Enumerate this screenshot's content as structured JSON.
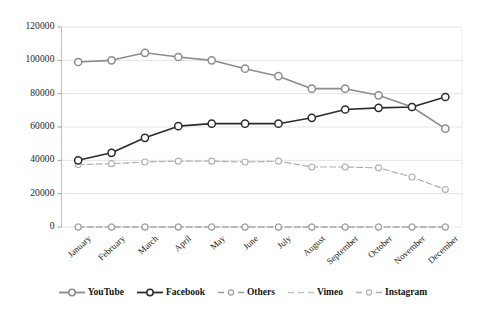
{
  "chart_data": {
    "type": "line",
    "title": "",
    "xlabel": "",
    "ylabel": "",
    "categories": [
      "January",
      "February",
      "March",
      "April",
      "May",
      "June",
      "July",
      "August",
      "September",
      "October",
      "November",
      "December"
    ],
    "ylim": [
      0,
      120000
    ],
    "ytick_values": [
      0,
      20000,
      40000,
      60000,
      80000,
      100000,
      120000
    ],
    "ytick_labels": [
      "0",
      "20000",
      "40000",
      "60000",
      "80000",
      "100000",
      "120000"
    ],
    "grid": "horizontal",
    "legend_position": "bottom",
    "series": [
      {
        "name": "YouTube",
        "color": "#8c8c8c",
        "marker": "circle-open",
        "dash": "solid",
        "values": [
          99000,
          100000,
          104500,
          102000,
          100000,
          95000,
          90500,
          83000,
          83000,
          79000,
          72000,
          59000
        ]
      },
      {
        "name": "Facebook",
        "color": "#2b2b2b",
        "marker": "circle-open",
        "dash": "solid",
        "values": [
          40000,
          44500,
          53500,
          60500,
          62000,
          62000,
          62000,
          65500,
          70500,
          71500,
          72000,
          78000
        ]
      },
      {
        "name": "Others",
        "color": "#9a9a9a",
        "marker": "circle-open",
        "dash": "dashed",
        "values": [
          0,
          0,
          0,
          0,
          0,
          0,
          0,
          0,
          0,
          0,
          0,
          0
        ]
      },
      {
        "name": "Vimeo",
        "color": "#c2c2c2",
        "marker": "circle-open",
        "dash": "dashed",
        "values": [
          0,
          0,
          0,
          0,
          0,
          0,
          0,
          0,
          0,
          0,
          0,
          0
        ]
      },
      {
        "name": "Instagram",
        "color": "#b0b0b0",
        "marker": "circle-open",
        "dash": "dashed",
        "values": [
          37500,
          38000,
          39000,
          39500,
          39500,
          39000,
          39500,
          36000,
          36000,
          35500,
          30000,
          22500
        ]
      }
    ]
  },
  "legend": {
    "items": [
      {
        "label": "YouTube"
      },
      {
        "label": "Facebook"
      },
      {
        "label": "Others"
      },
      {
        "label": "Vimeo"
      },
      {
        "label": "Instagram"
      }
    ]
  }
}
